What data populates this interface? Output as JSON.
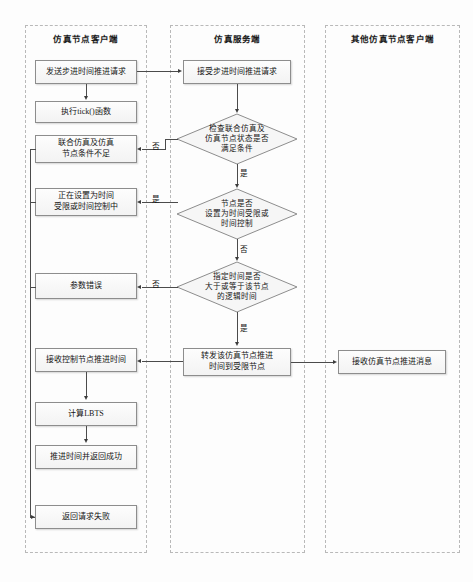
{
  "diagram": {
    "type": "flowchart",
    "title": "",
    "lanes": [
      {
        "id": "client",
        "label": "仿真节点客户端"
      },
      {
        "id": "server",
        "label": "仿真服务端"
      },
      {
        "id": "other_client",
        "label": "其他仿真节点客户端"
      }
    ],
    "nodes": [
      {
        "id": "n1",
        "lane": "client",
        "shape": "rect",
        "label": "发送步进时间推进请求"
      },
      {
        "id": "n2",
        "lane": "client",
        "shape": "rect",
        "label": "执行tick()函数"
      },
      {
        "id": "n3",
        "lane": "client",
        "shape": "rect",
        "label": "联合仿真及仿真\n节点条件不足"
      },
      {
        "id": "n3a",
        "lane": "client",
        "shape": "rect",
        "label_line1": "联合仿真及仿真",
        "label_line2": "节点条件不足"
      },
      {
        "id": "n4",
        "lane": "client",
        "shape": "rect",
        "label_line1": "正在设置为时间",
        "label_line2": "受限或时间控制中"
      },
      {
        "id": "n5",
        "lane": "client",
        "shape": "rect",
        "label": "参数错误"
      },
      {
        "id": "n6",
        "lane": "client",
        "shape": "rect",
        "label": "接收控制节点推进时间"
      },
      {
        "id": "n7",
        "lane": "client",
        "shape": "rect",
        "label": "计算LBTS"
      },
      {
        "id": "n8",
        "lane": "client",
        "shape": "rect",
        "label": "推进时间并返回成功"
      },
      {
        "id": "n9",
        "lane": "client",
        "shape": "rect",
        "label": "返回请求失败"
      },
      {
        "id": "s1",
        "lane": "server",
        "shape": "rect",
        "label": "接受步进时间推进请求"
      },
      {
        "id": "d1",
        "lane": "server",
        "shape": "diamond",
        "label_line1": "检查联合仿真及",
        "label_line2": "仿真节点状态是否",
        "label_line3": "满足条件"
      },
      {
        "id": "d2",
        "lane": "server",
        "shape": "diamond",
        "label_line1": "节点是否",
        "label_line2": "设置为时间受限或",
        "label_line3": "时间控制"
      },
      {
        "id": "d3",
        "lane": "server",
        "shape": "diamond",
        "label_line1": "指定时间是否",
        "label_line2": "大于或等于该节点",
        "label_line3": "的逻辑时间"
      },
      {
        "id": "s2",
        "lane": "server",
        "shape": "rect",
        "label_line1": "转发该仿真节点推进",
        "label_line2": "时间到受限节点"
      },
      {
        "id": "o1",
        "lane": "other_client",
        "shape": "rect",
        "label": "接收仿真节点推进消息"
      }
    ],
    "edge_labels": {
      "d1_no": "否",
      "d1_yes": "是",
      "d2_yes": "是",
      "d2_no": "否",
      "d3_no": "否",
      "d3_yes": "是"
    },
    "colors": {
      "node_border": "#8d8d8d",
      "node_fill": "#f6f6f6",
      "edge": "#4b4b4b",
      "lane_border": "#b9b9b9",
      "text": "#151515",
      "background": "#fdfdfd"
    }
  }
}
